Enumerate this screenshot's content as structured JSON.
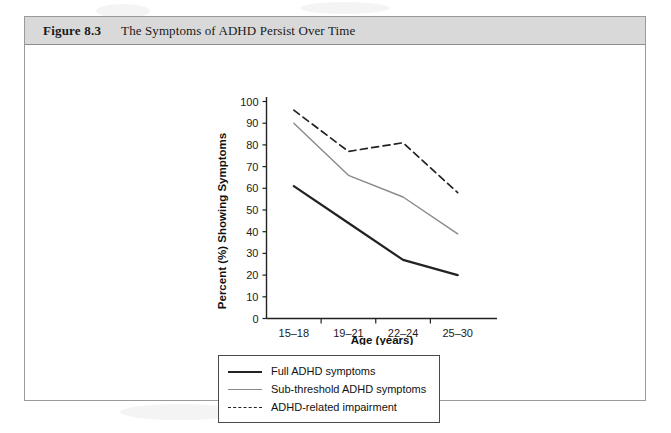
{
  "figure": {
    "number": "Figure 8.3",
    "title": "The Symptoms of ADHD Persist Over Time"
  },
  "chart_data": {
    "type": "line",
    "title": "The Symptoms of ADHD Persist Over Time",
    "xlabel": "Age (years)",
    "ylabel": "Percent (%) Showing Symptoms",
    "categories": [
      "15–18",
      "19–21",
      "22–24",
      "25–30"
    ],
    "ylim": [
      0,
      100
    ],
    "yticks": [
      0,
      10,
      20,
      30,
      40,
      50,
      60,
      70,
      80,
      90,
      100
    ],
    "grid": false,
    "legend_position": "below-plot",
    "series": [
      {
        "name": "Full ADHD symptoms",
        "values": [
          61,
          44,
          27,
          20
        ],
        "color": "#222222",
        "style": "solid",
        "width": 2.2
      },
      {
        "name": "Sub-threshold ADHD symptoms",
        "values": [
          90,
          66,
          56,
          39
        ],
        "color": "#8a8a8a",
        "style": "solid",
        "width": 1.4
      },
      {
        "name": "ADHD-related impairment",
        "values": [
          96,
          77,
          81,
          58
        ],
        "color": "#222222",
        "style": "dashed",
        "width": 1.7
      }
    ]
  },
  "axis": {
    "y_ticks": [
      "0",
      "10",
      "20",
      "30",
      "40",
      "50",
      "60",
      "70",
      "80",
      "90",
      "100"
    ],
    "y_title": "Percent (%) Showing Symptoms",
    "x_ticks": [
      "15–18",
      "19–21",
      "22–24",
      "25–30"
    ],
    "x_title": "Age (years)"
  },
  "legend": {
    "items": [
      {
        "label": "Full ADHD symptoms",
        "swatch": "solid-thick-black-line-icon"
      },
      {
        "label": "Sub-threshold ADHD symptoms",
        "swatch": "solid-thin-gray-line-icon"
      },
      {
        "label": "ADHD-related impairment",
        "swatch": "dashed-black-line-icon"
      }
    ]
  }
}
